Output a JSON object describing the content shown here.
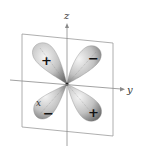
{
  "figure": {
    "type": "d-orbital lobes diagram",
    "axes": {
      "z_label": "z",
      "y_label": "y",
      "x_label": "x"
    },
    "lobes": [
      {
        "position": "upper-left",
        "sign": "+"
      },
      {
        "position": "upper-right",
        "sign": "−"
      },
      {
        "position": "lower-left",
        "sign": "−"
      },
      {
        "position": "lower-right",
        "sign": "+"
      }
    ],
    "colors": {
      "lobe_light": "#f2f2f2",
      "lobe_mid": "#bdbdbd",
      "lobe_dark": "#6e6e6e",
      "axis": "#8a8a8a",
      "plane": "#9a9a9a"
    }
  }
}
